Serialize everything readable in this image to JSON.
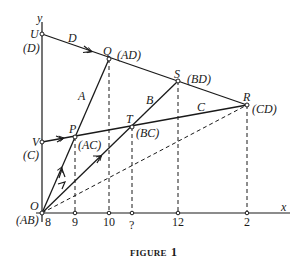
{
  "figure": {
    "caption_word": "FIGURE",
    "caption_number": "1",
    "axes": {
      "x_label": "x",
      "y_label": "y"
    },
    "points": {
      "U": {
        "label": "U",
        "tag": "(D)"
      },
      "Q": {
        "label": "Q",
        "tag": "(AD)"
      },
      "S": {
        "label": "S",
        "tag": "(BD)"
      },
      "R": {
        "label": "R",
        "tag": "(CD)"
      },
      "V": {
        "label": "V",
        "tag": "(C)"
      },
      "P": {
        "label": "P",
        "tag": "(AC)"
      },
      "T": {
        "label": "T",
        "tag": "(BC)"
      },
      "O": {
        "label": "O",
        "tag": "(AB)"
      }
    },
    "line_labels": {
      "A": "A",
      "B": "B",
      "C": "C",
      "D": "D"
    },
    "x_ticks": [
      "8",
      "9",
      "10",
      "?",
      "12",
      "2"
    ],
    "colors": {
      "ink": "#1a1a1a",
      "background": "#ffffff"
    }
  }
}
